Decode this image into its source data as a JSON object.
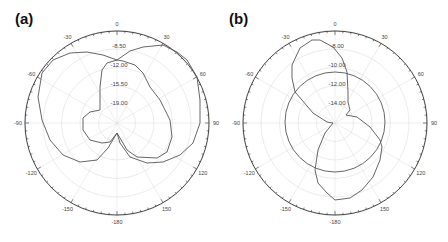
{
  "chart_data": [
    {
      "type": "polar-line",
      "panel_label": "(a)",
      "center_px": [
        117,
        123
      ],
      "outer_radius_px": 92,
      "angle_ticks": [
        "0",
        "30",
        "60",
        "90",
        "120",
        "150",
        "-180",
        "-150",
        "-120",
        "-90",
        "-60",
        "-30"
      ],
      "radial_labels": [
        "-8.50",
        "-12.00",
        "-15.50",
        "-19.00"
      ],
      "radial_label_radii_px": [
        77,
        58,
        39,
        20
      ],
      "radial_range_db": [
        -22.5,
        -5.0
      ],
      "grid": true,
      "line_color": "#555555",
      "grid_color": "#dddddd",
      "traces": [
        {
          "name": "outer",
          "points_px": [
            [
              163,
              45
            ],
            [
              143,
              47
            ],
            [
              130,
              51
            ],
            [
              117,
              60
            ],
            [
              103,
              55
            ],
            [
              87,
              52
            ],
            [
              70,
              53
            ],
            [
              53,
              60
            ],
            [
              42,
              73
            ],
            [
              38,
              97
            ],
            [
              42,
              120
            ],
            [
              50,
              140
            ],
            [
              63,
              155
            ],
            [
              80,
              162
            ],
            [
              97,
              160
            ],
            [
              108,
              148
            ],
            [
              117,
              133
            ],
            [
              120,
              143
            ],
            [
              130,
              157
            ],
            [
              147,
              163
            ],
            [
              163,
              162
            ],
            [
              180,
              155
            ],
            [
              193,
              143
            ],
            [
              200,
              123
            ],
            [
              200,
              100
            ],
            [
              197,
              77
            ],
            [
              187,
              60
            ],
            [
              177,
              52
            ],
            [
              163,
              45
            ]
          ]
        },
        {
          "name": "inner",
          "points_px": [
            [
              117,
              60
            ],
            [
              107,
              63
            ],
            [
              102,
              70
            ],
            [
              100,
              87
            ],
            [
              100,
              110
            ],
            [
              90,
              112
            ],
            [
              83,
              118
            ],
            [
              83,
              130
            ],
            [
              90,
              140
            ],
            [
              102,
              143
            ],
            [
              110,
              142
            ],
            [
              117,
              133
            ],
            [
              120,
              138
            ],
            [
              127,
              150
            ],
            [
              137,
              157
            ],
            [
              157,
              158
            ],
            [
              167,
              152
            ],
            [
              172,
              137
            ],
            [
              170,
              120
            ],
            [
              160,
              100
            ],
            [
              150,
              87
            ],
            [
              143,
              73
            ],
            [
              135,
              65
            ],
            [
              123,
              61
            ],
            [
              117,
              60
            ]
          ]
        }
      ]
    },
    {
      "type": "polar-line",
      "panel_label": "(b)",
      "center_px": [
        335,
        123
      ],
      "outer_radius_px": 92,
      "angle_ticks": [
        "0",
        "30",
        "60",
        "90",
        "120",
        "150",
        "-180",
        "-150",
        "-120",
        "-90",
        "-60",
        "-30"
      ],
      "radial_labels": [
        "-8.00",
        "-10.00",
        "-12.00",
        "-14.00"
      ],
      "radial_label_radii_px": [
        77,
        58,
        39,
        20
      ],
      "radial_range_db": [
        -16.0,
        -6.0
      ],
      "grid": true,
      "line_color": "#555555",
      "grid_color": "#dddddd",
      "traces": [
        {
          "name": "figure-eight",
          "points_px": [
            [
              320,
              40
            ],
            [
              312,
              40
            ],
            [
              300,
              48
            ],
            [
              292,
              65
            ],
            [
              292,
              78
            ],
            [
              295,
              92
            ],
            [
              302,
              100
            ],
            [
              313,
              113
            ],
            [
              327,
              122
            ],
            [
              333,
              123
            ],
            [
              325,
              133
            ],
            [
              318,
              150
            ],
            [
              315,
              170
            ],
            [
              318,
              183
            ],
            [
              327,
              193
            ],
            [
              335,
              200
            ],
            [
              350,
              198
            ],
            [
              362,
              190
            ],
            [
              373,
              177
            ],
            [
              380,
              160
            ],
            [
              382,
              147
            ],
            [
              380,
              140
            ],
            [
              370,
              127
            ],
            [
              357,
              117
            ],
            [
              346,
              115
            ],
            [
              350,
              110
            ],
            [
              348,
              102
            ],
            [
              348,
              92
            ],
            [
              347,
              72
            ],
            [
              342,
              58
            ],
            [
              333,
              47
            ],
            [
              320,
              40
            ]
          ]
        },
        {
          "name": "circle",
          "circle": {
            "cx": 335,
            "cy": 122,
            "r": 50
          }
        }
      ]
    }
  ]
}
